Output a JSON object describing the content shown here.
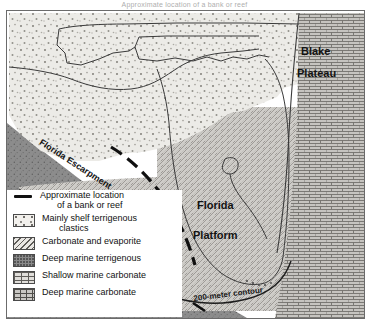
{
  "title_strip": {
    "text": "Approximate location of a bank or reef"
  },
  "map": {
    "labels": [
      {
        "name": "blake-label",
        "text": "Blake"
      },
      {
        "name": "plateau-label",
        "text": "Plateau"
      },
      {
        "name": "florida-label",
        "text": "Florida"
      },
      {
        "name": "platform-label",
        "text": "Platform"
      },
      {
        "name": "escarpment-label",
        "text": "Florida Escarpment"
      },
      {
        "name": "contour-label",
        "text": "200-meter contour"
      }
    ],
    "blake": "Blake",
    "plateau": "Plateau",
    "florida": "Florida",
    "platform": "Platform",
    "escarpment": "Florida Escarpment",
    "contour": "200-meter contour"
  },
  "legend": {
    "items": [
      {
        "swatch": "bank-reef-line",
        "line1": "Approximate location",
        "line2": "of a bank or reef"
      },
      {
        "swatch": "clastics",
        "line1": "Mainly shelf terrigenous",
        "line2": "clastics"
      },
      {
        "swatch": "carbonate-evaporite",
        "line1": "Carbonate and evaporite",
        "line2": ""
      },
      {
        "swatch": "deep-marine-terrigenous",
        "line1": "Deep marine terrigenous",
        "line2": ""
      },
      {
        "swatch": "shallow-marine-carbonate",
        "line1": "Shallow marine carbonate",
        "line2": ""
      },
      {
        "swatch": "deep-marine-carbonate",
        "line1": "Deep marine carbonate",
        "line2": ""
      }
    ]
  },
  "colors": {
    "ink": "#131313",
    "frame": "#6b6b6b",
    "deep_terrigenous": "#8d8d8d",
    "clastics": "#eceae6",
    "shallow_carbonate": "#d6d4d0",
    "deep_carbonate": "#c3c1bd",
    "platform": "#cfcdc9",
    "blank_ocean": "#ffffff"
  }
}
